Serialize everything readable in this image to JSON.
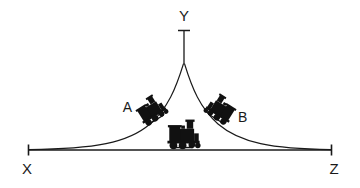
{
  "figure": {
    "background_color": "#ffffff",
    "ink_color": "#1a1a1a",
    "labels": {
      "apex": "Y",
      "left_end": "X",
      "right_end": "Z",
      "left_vehicle": "A",
      "right_vehicle": "B"
    },
    "baseline": {
      "name": "XZ",
      "x_start": 28,
      "x_end": 332,
      "y": 150,
      "tick_height": 11
    },
    "apex": {
      "x": 184,
      "curve_top_y": 64,
      "pole_top_y": 26,
      "cap_half_width": 6,
      "cap_y": 31
    },
    "curves": [
      {
        "name": "left-slope",
        "from_x": 28,
        "from_y": 150,
        "to_x": 184,
        "to_y": 64,
        "shape": "asymptotic-bell-flank"
      },
      {
        "name": "right-slope",
        "from_x": 184,
        "from_y": 64,
        "to_x": 332,
        "to_y": 150,
        "shape": "asymptotic-bell-flank"
      }
    ],
    "vehicles": [
      {
        "id": "A",
        "name": "locomotive-a",
        "center_x": 152,
        "center_y": 111,
        "rotation_deg": -32,
        "scale": 0.78,
        "label_x": 131,
        "label_y": 110,
        "label_anchor": "end"
      },
      {
        "id": "B",
        "name": "locomotive-b",
        "center_x": 220,
        "center_y": 110,
        "rotation_deg": 32,
        "scale": 0.78,
        "label_x": 239,
        "label_y": 120,
        "label_anchor": "start"
      },
      {
        "id": "C",
        "name": "locomotive-center",
        "center_x": 184,
        "center_y": 139,
        "rotation_deg": 0,
        "scale": 0.92,
        "label_x": 0,
        "label_y": 0,
        "label_anchor": "middle"
      }
    ],
    "label_positions": {
      "apex": {
        "x": 184,
        "y": 20
      },
      "left_end": {
        "x": 27,
        "y": 172
      },
      "right_end": {
        "x": 333,
        "y": 172
      }
    }
  }
}
